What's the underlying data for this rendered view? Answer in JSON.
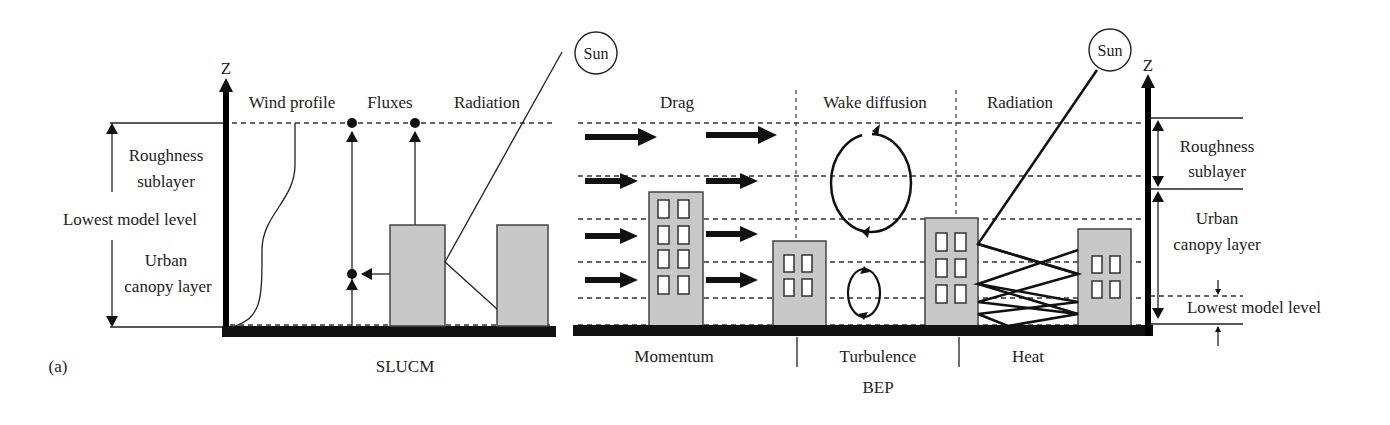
{
  "figure": {
    "panel_label": "(a)",
    "left_model": {
      "name": "SLUCM",
      "axis_label": "Z",
      "column_headers": [
        "Wind profile",
        "Fluxes",
        "Radiation"
      ],
      "sun_label": "Sun",
      "side_labels": {
        "roughness_1": "Roughness",
        "roughness_2": "sublayer",
        "lowest": "Lowest model level",
        "urban_1": "Urban",
        "urban_2": "canopy layer"
      }
    },
    "right_model": {
      "name": "BEP",
      "axis_label": "Z",
      "sun_label": "Sun",
      "column_headers": [
        "Drag",
        "Wake diffusion",
        "Radiation"
      ],
      "bottom_labels": [
        "Momentum",
        "Turbulence",
        "Heat"
      ],
      "side_labels": {
        "roughness_1": "Roughness",
        "roughness_2": "sublayer",
        "urban_1": "Urban",
        "urban_2": "canopy layer",
        "lowest": "Lowest model level"
      }
    },
    "colors": {
      "building_fill": "#c8c8c8",
      "ink": "#222222",
      "background": "#ffffff"
    }
  }
}
